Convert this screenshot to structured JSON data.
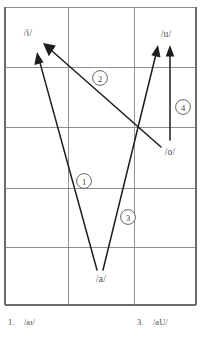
{
  "figure": {
    "background_color": "#ffffff",
    "ink_color": "#1d1d1d",
    "grid_color": "#8f8f8f"
  },
  "grid": {
    "columns": 3,
    "rows": 5,
    "x_lines": [
      5,
      68,
      134,
      196
    ],
    "y_lines": [
      7,
      67,
      127,
      188,
      247,
      305
    ]
  },
  "vowels": [
    {
      "id": "i",
      "label": "/i/",
      "x": 28,
      "y": 33
    },
    {
      "id": "u",
      "label": "/u/",
      "x": 166,
      "y": 34
    },
    {
      "id": "o",
      "label": "/o/",
      "x": 170,
      "y": 152
    },
    {
      "id": "a",
      "label": "/a/",
      "x": 101,
      "y": 279
    }
  ],
  "arrows": [
    {
      "id": "arrow-1",
      "marker": "1",
      "from_vowel": "a",
      "to_vowel": "i",
      "start": {
        "x": 97,
        "y": 270
      },
      "end": {
        "x": 37,
        "y": 52
      },
      "marker_pos": {
        "x": 84,
        "y": 181
      }
    },
    {
      "id": "arrow-2",
      "marker": "2",
      "from_vowel": "o",
      "to_vowel": "i",
      "start": {
        "x": 161,
        "y": 147
      },
      "end": {
        "x": 43,
        "y": 43
      },
      "marker_pos": {
        "x": 100,
        "y": 78
      }
    },
    {
      "id": "arrow-3",
      "marker": "3",
      "from_vowel": "a",
      "to_vowel": "u",
      "start": {
        "x": 103,
        "y": 270
      },
      "end": {
        "x": 158,
        "y": 45
      },
      "marker_pos": {
        "x": 128,
        "y": 217
      }
    },
    {
      "id": "arrow-4",
      "marker": "4",
      "from_vowel": "o",
      "to_vowel": "u",
      "start": {
        "x": 170,
        "y": 140
      },
      "end": {
        "x": 170,
        "y": 45
      },
      "marker_pos": {
        "x": 183,
        "y": 107
      }
    }
  ],
  "legend": {
    "item_1": {
      "number": "1.",
      "symbol": "/aɪ/"
    },
    "item_3": {
      "number": "3.",
      "symbol": "/aU/"
    }
  }
}
